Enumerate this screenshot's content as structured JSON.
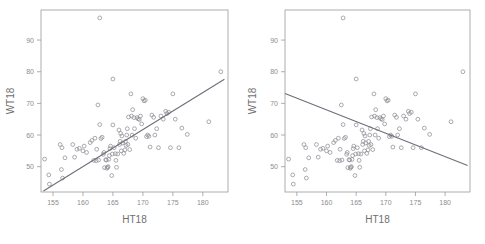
{
  "figure": {
    "panel_count": 2,
    "caption": ""
  },
  "chart_data": [
    {
      "type": "scatter",
      "panel": "left",
      "title": "",
      "xlabel": "HT18",
      "ylabel": "WT18",
      "xlim": [
        153.0,
        184.2
      ],
      "ylim": [
        42.0,
        99.5
      ],
      "xticks": [
        155,
        160,
        165,
        170,
        175,
        180
      ],
      "yticks": [
        50,
        60,
        70,
        80,
        90
      ],
      "grid": false,
      "legend": null,
      "marker": "open-circle",
      "marker_color": "#8e8e96",
      "line_color": "#6e6e7a",
      "trendline": {
        "type": "linear",
        "direction": "positive",
        "x": [
          153.4,
          183.6
        ],
        "y": [
          42.3,
          77.6
        ],
        "slope": 1.17,
        "intercept": -137.1
      },
      "x": [
        153.6,
        154.3,
        154.4,
        156.2,
        156.4,
        156.5,
        156.6,
        157.0,
        158.3,
        158.6,
        159.0,
        159.4,
        160.0,
        160.2,
        160.6,
        161.2,
        161.5,
        161.8,
        162.0,
        162.2,
        162.3,
        162.5,
        162.6,
        162.8,
        162.8,
        163.0,
        163.2,
        163.4,
        163.5,
        163.6,
        163.8,
        163.9,
        164.0,
        164.1,
        164.2,
        164.3,
        164.4,
        164.5,
        164.6,
        164.8,
        164.9,
        165.0,
        165.0,
        165.2,
        165.4,
        165.5,
        165.6,
        165.8,
        166.0,
        166.1,
        166.2,
        166.3,
        166.4,
        166.5,
        166.6,
        166.8,
        167.0,
        167.1,
        167.2,
        167.3,
        167.4,
        167.5,
        167.6,
        167.8,
        168.0,
        168.1,
        168.2,
        168.3,
        168.5,
        168.6,
        168.8,
        169.0,
        169.2,
        169.4,
        169.6,
        169.8,
        170.0,
        170.2,
        170.4,
        170.6,
        170.8,
        171.0,
        171.2,
        171.5,
        171.8,
        172.0,
        172.3,
        172.6,
        173.0,
        173.4,
        173.8,
        174.0,
        174.3,
        174.6,
        175.0,
        175.4,
        176.0,
        176.5,
        177.4,
        181.0,
        183.0
      ],
      "y": [
        52.4,
        47.4,
        44.5,
        57.0,
        49.1,
        56.0,
        46.4,
        52.8,
        57.0,
        53.0,
        55.5,
        55.8,
        55.0,
        56.5,
        54.5,
        57.6,
        58.3,
        52.0,
        59.0,
        51.9,
        55.5,
        69.5,
        52.1,
        97.0,
        63.3,
        58.9,
        59.3,
        53.9,
        54.5,
        49.7,
        52.2,
        52.1,
        49.5,
        49.8,
        50.0,
        52.3,
        53.5,
        55.7,
        56.5,
        47.2,
        54.0,
        77.7,
        63.2,
        56.0,
        54.1,
        52.0,
        49.8,
        54.0,
        61.6,
        57.0,
        58.0,
        60.5,
        55.0,
        59.7,
        57.5,
        54.2,
        55.3,
        58.0,
        56.7,
        60.0,
        62.0,
        57.0,
        65.7,
        55.4,
        73.0,
        66.0,
        60.0,
        68.0,
        65.5,
        62.0,
        59.0,
        65.5,
        65.1,
        64.9,
        66.0,
        63.5,
        71.5,
        70.8,
        71.0,
        59.5,
        60.0,
        59.6,
        56.2,
        66.3,
        65.6,
        60.0,
        62.0,
        56.0,
        66.0,
        65.0,
        67.5,
        66.8,
        67.2,
        56.0,
        73.0,
        65.0,
        56.0,
        62.2,
        60.2,
        64.2,
        80.0
      ]
    },
    {
      "type": "scatter",
      "panel": "right",
      "title": "",
      "xlabel": "HT18",
      "ylabel": "WT18",
      "xlim": [
        153.0,
        184.2
      ],
      "ylim": [
        42.0,
        99.5
      ],
      "xticks": [
        155,
        160,
        165,
        170,
        175,
        180
      ],
      "yticks": [
        50,
        60,
        70,
        80,
        90
      ],
      "grid": false,
      "legend": null,
      "marker": "open-circle",
      "marker_color": "#8e8e96",
      "line_color": "#6e6e7a",
      "trendline": {
        "type": "linear",
        "direction": "negative",
        "x": [
          152.6,
          183.8
        ],
        "y": [
          73.1,
          50.4
        ],
        "slope": -0.727,
        "intercept": 184.0
      },
      "x": [
        153.6,
        154.3,
        154.4,
        156.2,
        156.4,
        156.5,
        156.6,
        157.0,
        158.3,
        158.6,
        159.0,
        159.4,
        160.0,
        160.2,
        160.6,
        161.2,
        161.5,
        161.8,
        162.0,
        162.2,
        162.3,
        162.5,
        162.6,
        162.8,
        162.8,
        163.0,
        163.2,
        163.4,
        163.5,
        163.6,
        163.8,
        163.9,
        164.0,
        164.1,
        164.2,
        164.3,
        164.4,
        164.5,
        164.6,
        164.8,
        164.9,
        165.0,
        165.0,
        165.2,
        165.4,
        165.5,
        165.6,
        165.8,
        166.0,
        166.1,
        166.2,
        166.3,
        166.4,
        166.5,
        166.6,
        166.8,
        167.0,
        167.1,
        167.2,
        167.3,
        167.4,
        167.5,
        167.6,
        167.8,
        168.0,
        168.1,
        168.2,
        168.3,
        168.5,
        168.6,
        168.8,
        169.0,
        169.2,
        169.4,
        169.6,
        169.8,
        170.0,
        170.2,
        170.4,
        170.6,
        170.8,
        171.0,
        171.2,
        171.5,
        171.8,
        172.0,
        172.3,
        172.6,
        173.0,
        173.4,
        173.8,
        174.0,
        174.3,
        174.6,
        175.0,
        175.4,
        176.0,
        176.5,
        177.4,
        181.0,
        183.0
      ],
      "y": [
        52.4,
        47.4,
        44.5,
        57.0,
        49.1,
        56.0,
        46.4,
        52.8,
        57.0,
        53.0,
        55.5,
        55.8,
        55.0,
        56.5,
        54.5,
        57.6,
        58.3,
        52.0,
        59.0,
        51.9,
        55.5,
        69.5,
        52.1,
        97.0,
        63.3,
        58.9,
        59.3,
        53.9,
        54.5,
        49.7,
        52.2,
        52.1,
        49.5,
        49.8,
        50.0,
        52.3,
        53.5,
        55.7,
        56.5,
        47.2,
        54.0,
        77.7,
        63.2,
        56.0,
        54.1,
        52.0,
        49.8,
        54.0,
        61.6,
        57.0,
        58.0,
        60.5,
        55.0,
        59.7,
        57.5,
        54.2,
        55.3,
        58.0,
        56.7,
        60.0,
        62.0,
        57.0,
        65.7,
        55.4,
        73.0,
        66.0,
        60.0,
        68.0,
        65.5,
        62.0,
        59.0,
        65.5,
        65.1,
        64.9,
        66.0,
        63.5,
        71.5,
        70.8,
        71.0,
        59.5,
        60.0,
        59.6,
        56.2,
        66.3,
        65.6,
        60.0,
        62.0,
        56.0,
        66.0,
        65.0,
        67.5,
        66.8,
        67.2,
        56.0,
        73.0,
        65.0,
        56.0,
        62.2,
        60.2,
        64.2,
        80.0
      ]
    }
  ]
}
